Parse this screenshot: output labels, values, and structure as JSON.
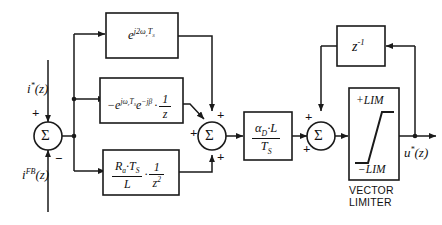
{
  "diagram": {
    "stroke_color": "#1a1a1a",
    "background_color": "#ffffff"
  },
  "inputs": {
    "reference": {
      "base": "i",
      "star": "*",
      "arg": "(z)",
      "full": "i*(z)"
    },
    "feedback": {
      "base": "i",
      "sup": "FB",
      "arg": "(z)",
      "full": "i^FB(z)"
    }
  },
  "outputs": {
    "control": {
      "base": "u",
      "star": "*",
      "arg": "(z)",
      "full": "u*(z)"
    }
  },
  "summers": {
    "input_sum": {
      "glyph": "Σ",
      "plus": "+",
      "minus": "−",
      "top_sign": "+",
      "bottom_sign": "−"
    },
    "middle_sum": {
      "glyph": "Σ",
      "left_sign": "+",
      "top_sign": "+",
      "bottom_sign": "+"
    },
    "output_sum": {
      "glyph": "Σ",
      "top_sign": "+",
      "left_sign": "+"
    }
  },
  "blocks": {
    "decoupling_2w": {
      "name": "e^{j2 omega_r T_S}",
      "base": "e",
      "exponent_j": "j2",
      "exponent_omega": "ω",
      "exponent_sub": "r",
      "exponent_T": "T",
      "exponent_T_sub": "S"
    },
    "delay_compensation": {
      "name": "-e^{j omega_r T_S} e^{-j beta} . 1/z",
      "minus": "−",
      "base": "e",
      "exp_j": "j",
      "exp_omega": "ω",
      "exp_sub": "r",
      "exp_T": "T",
      "exp_T_sub": "S",
      "base2": "e",
      "exp2": "−jβ",
      "dot": "·",
      "frac_num": "1",
      "frac_den": "z"
    },
    "resistive_term": {
      "name": "(R_a T_S / L) . (1 / z^2)",
      "num_R": "R",
      "num_R_sub": "a",
      "num_dot": "·",
      "num_T": "T",
      "num_T_sub": "S",
      "den": "L",
      "dot": "·",
      "frac2_num": "1",
      "frac2_den": "z",
      "frac2_den_sup": "2"
    },
    "gain": {
      "name": "alpha_D L / T_S",
      "num_alpha": "α",
      "num_alpha_sub": "D",
      "num_dot": "·",
      "num_L": "L",
      "den_T": "T",
      "den_T_sub": "S"
    },
    "unit_delay": {
      "name": "z^-1",
      "base": "z",
      "exponent": "-1"
    },
    "vector_limiter": {
      "upper_limit": "+LIM",
      "lower_limit": "−LIM",
      "caption_line1": "VECTOR",
      "caption_line2": "LIMITER"
    }
  }
}
